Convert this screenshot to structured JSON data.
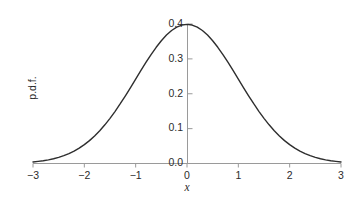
{
  "chart_data": {
    "type": "line",
    "title": "",
    "subtitle": "",
    "xlabel": "x",
    "ylabel": "p.d.f.",
    "xlim": [
      -3,
      3
    ],
    "ylim": [
      0,
      0.4
    ],
    "grid": false,
    "legend": false,
    "legend_position": "none",
    "annotations": [],
    "xticks": [
      -3,
      -2,
      -1,
      0,
      1,
      2,
      3
    ],
    "xtick_labels": [
      "−3",
      "−2",
      "−1",
      "0",
      "1",
      "2",
      "3"
    ],
    "yticks": [
      0.0,
      0.1,
      0.2,
      0.3,
      0.4
    ],
    "ytick_labels": [
      "0.0",
      "0.1",
      "0.2",
      "0.3",
      "0.4"
    ],
    "series": [
      {
        "name": "standard normal p.d.f.",
        "color": "#2e2e2e",
        "x": [
          -3.0,
          -2.9,
          -2.8,
          -2.7,
          -2.6,
          -2.5,
          -2.4,
          -2.3,
          -2.2,
          -2.1,
          -2.0,
          -1.9,
          -1.8,
          -1.7,
          -1.6,
          -1.5,
          -1.4,
          -1.3,
          -1.2,
          -1.1,
          -1.0,
          -0.9,
          -0.8,
          -0.7,
          -0.6,
          -0.5,
          -0.4,
          -0.3,
          -0.2,
          -0.1,
          0.0,
          0.1,
          0.2,
          0.3,
          0.4,
          0.5,
          0.6,
          0.7,
          0.8,
          0.9,
          1.0,
          1.1,
          1.2,
          1.3,
          1.4,
          1.5,
          1.6,
          1.7,
          1.8,
          1.9,
          2.0,
          2.1,
          2.2,
          2.3,
          2.4,
          2.5,
          2.6,
          2.7,
          2.8,
          2.9,
          3.0
        ],
        "y": [
          0.0044,
          0.006,
          0.0079,
          0.0104,
          0.0136,
          0.0175,
          0.0224,
          0.0283,
          0.0355,
          0.044,
          0.054,
          0.0656,
          0.079,
          0.094,
          0.1109,
          0.1295,
          0.1497,
          0.1714,
          0.1942,
          0.2179,
          0.242,
          0.2661,
          0.2897,
          0.3123,
          0.3332,
          0.3521,
          0.3683,
          0.3814,
          0.391,
          0.397,
          0.3989,
          0.397,
          0.391,
          0.3814,
          0.3683,
          0.3521,
          0.3332,
          0.3123,
          0.2897,
          0.2661,
          0.242,
          0.2179,
          0.1942,
          0.1714,
          0.1497,
          0.1295,
          0.1109,
          0.094,
          0.079,
          0.0656,
          0.054,
          0.044,
          0.0355,
          0.0283,
          0.0224,
          0.0175,
          0.0136,
          0.0104,
          0.0079,
          0.006,
          0.0044
        ]
      }
    ]
  },
  "style": {
    "curve_color": "#2e2e2e",
    "axis_color": "#9a9a9a",
    "text_color": "#2b2b2b",
    "background": "#ffffff"
  }
}
